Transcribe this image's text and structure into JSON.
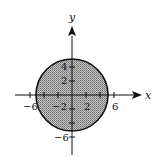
{
  "diagram": {
    "region": {
      "shape": "disk",
      "center": [
        0,
        0
      ],
      "radius": 5,
      "fill": "#a8a8a8",
      "stroke": "#111111",
      "pattern": "stippled"
    },
    "axes": {
      "x_label": "x",
      "y_label": "y",
      "x_ticks": [
        -6,
        -4,
        -2,
        0,
        2,
        4,
        6
      ],
      "y_ticks": [
        -6,
        -4,
        -2,
        0,
        2,
        4
      ],
      "x_tick_labels": [
        "-6",
        "-2",
        "2",
        "6"
      ],
      "y_tick_labels": [
        "4",
        "2",
        "-6"
      ]
    },
    "labels": {
      "x_axis": "x",
      "y_axis": "y",
      "xt_neg6": "−6",
      "xt_neg2": "−2",
      "xt_2": "2",
      "xt_6": "6",
      "yt_4": "4",
      "yt_2": "2",
      "yt_neg6": "−6"
    }
  }
}
